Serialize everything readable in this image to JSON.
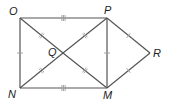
{
  "figure": {
    "type": "geometry",
    "points": {
      "O": {
        "label": "O",
        "x": 20,
        "y": 18
      },
      "P": {
        "label": "P",
        "x": 107,
        "y": 18
      },
      "N": {
        "label": "N",
        "x": 20,
        "y": 88
      },
      "M": {
        "label": "M",
        "x": 107,
        "y": 88
      },
      "Q": {
        "label": "Q",
        "x": 63,
        "y": 53
      },
      "R": {
        "label": "R",
        "x": 150,
        "y": 53
      }
    },
    "segments": [
      {
        "from": "O",
        "to": "P",
        "ticks": 3
      },
      {
        "from": "N",
        "to": "M",
        "ticks": 3
      },
      {
        "from": "O",
        "to": "N",
        "ticks": 1
      },
      {
        "from": "P",
        "to": "M",
        "ticks": 1
      },
      {
        "from": "O",
        "to": "Q",
        "ticks": 2
      },
      {
        "from": "Q",
        "to": "M",
        "ticks": 2
      },
      {
        "from": "N",
        "to": "Q",
        "ticks": 2
      },
      {
        "from": "Q",
        "to": "P",
        "ticks": 2
      },
      {
        "from": "P",
        "to": "R",
        "ticks": 1
      },
      {
        "from": "R",
        "to": "M",
        "ticks": 1
      }
    ],
    "colors": {
      "line": "#555555",
      "tick": "#9a9a9a",
      "label": "#222222"
    }
  }
}
